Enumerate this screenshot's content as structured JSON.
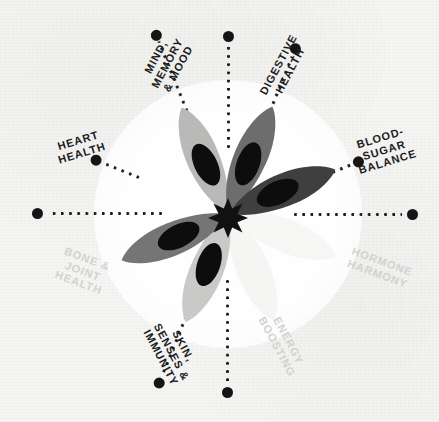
{
  "graphic": {
    "title": "Benefits wheel",
    "center_icon": "flower-star-icon",
    "background_color": "#f5f5f3",
    "accent_dark": "#1c1c1c",
    "accent_faded": "#d2d2d0"
  },
  "wheel": {
    "center_x": 228,
    "center_y": 214,
    "spoke_count": 8,
    "spokes": [
      {
        "id": "mind-memory-mood",
        "label": "MIND,\nMEMORY\n& MOOD",
        "angle": -112,
        "faded": false,
        "has_line": true,
        "line_start": 78,
        "line_end": 186,
        "dot_radius": 192,
        "label_radius": 162,
        "label_rotation": -62,
        "label_width": 78
      },
      {
        "id": "digestive-health",
        "label": "DIGESTIVE\nHEALTH",
        "angle": -68,
        "faded": false,
        "has_line": true,
        "line_start": 78,
        "line_end": 170,
        "dot_radius": 178,
        "label_radius": 150,
        "label_rotation": -62,
        "label_width": 86
      },
      {
        "id": "blood-sugar-balance",
        "label": "BLOOD-\nSUGAR\nBALANCE",
        "angle": -22,
        "faded": false,
        "has_line": true,
        "line_start": 96,
        "line_end": 132,
        "dot_radius": 140,
        "label_radius": 168,
        "label_rotation": -17,
        "label_width": 86
      },
      {
        "id": "hormone-harmony",
        "label": "HORMONE\nHARMONY",
        "angle": 22,
        "faded": true,
        "has_line": false,
        "line_start": 0,
        "line_end": 0,
        "dot_radius": 0,
        "label_radius": 164,
        "label_rotation": 20,
        "label_width": 92
      },
      {
        "id": "energy-boosting",
        "label": "ENERGY\nBOOSTING",
        "angle": 68,
        "faded": true,
        "has_line": false,
        "line_start": 0,
        "line_end": 0,
        "dot_radius": 0,
        "label_radius": 148,
        "label_rotation": 62,
        "label_width": 86
      },
      {
        "id": "skin-senses-immunity",
        "label": "SKIN,\nSENSES &\nIMMUNITY",
        "angle": 112,
        "faded": false,
        "has_line": true,
        "line_start": 78,
        "line_end": 176,
        "dot_radius": 182,
        "label_radius": 150,
        "label_rotation": 62,
        "label_width": 86
      },
      {
        "id": "bone-joint-health",
        "label": "BONE &\nJOINT\nHEALTH",
        "angle": 158,
        "faded": true,
        "has_line": false,
        "line_start": 0,
        "line_end": 0,
        "dot_radius": 0,
        "label_radius": 156,
        "label_rotation": 20,
        "label_width": 80
      },
      {
        "id": "heart-health",
        "label": "HEART\nHEALTH",
        "angle": 202,
        "faded": false,
        "has_line": true,
        "line_start": 96,
        "line_end": 134,
        "dot_radius": 142,
        "label_radius": 160,
        "label_rotation": -17,
        "label_width": 80
      }
    ],
    "axis_spokes": [
      {
        "id": "top-axis",
        "angle": -90,
        "line_start": 66,
        "line_end": 168,
        "dot_radius": 177
      },
      {
        "id": "right-axis",
        "angle": 0,
        "line_start": 66,
        "line_end": 174,
        "dot_radius": 184
      },
      {
        "id": "bottom-axis",
        "angle": 90,
        "line_start": 66,
        "line_end": 170,
        "dot_radius": 178
      },
      {
        "id": "left-axis",
        "angle": 180,
        "line_start": 66,
        "line_end": 180,
        "dot_radius": 190
      }
    ]
  },
  "flower": {
    "petal_colors": {
      "top_left": "#b9b9b7",
      "top_right": "#6d6d6d",
      "left": "#757575",
      "right": "#3f3f3f",
      "bottom_left": "#c9c9c7",
      "bottom_right_ghost": "#ededeb"
    },
    "inner_color": "#0d0d0d",
    "center_color": "#111111"
  }
}
